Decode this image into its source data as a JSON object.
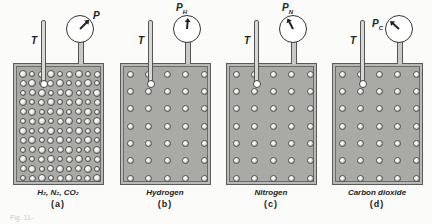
{
  "figure": {
    "caption_fragment": "Fig. 11-",
    "panels": [
      {
        "id": "a",
        "letter": "(a)",
        "gas_label": "H₂, N₂, CO₂",
        "thermometer_label": "T",
        "gauge_label": "P",
        "gauge_subscript": "",
        "needle_angle_deg": 45,
        "needle_length": 10,
        "grid_cols": 9,
        "grid_rows": 12,
        "mixed_sizes": true
      },
      {
        "id": "b",
        "letter": "(b)",
        "gas_label": "Hydrogen",
        "thermometer_label": "T",
        "gauge_label": "P",
        "gauge_subscript": "H",
        "needle_angle_deg": 5,
        "needle_length": 8,
        "grid_cols": 5,
        "grid_rows": 7,
        "mixed_sizes": false
      },
      {
        "id": "c",
        "letter": "(c)",
        "gas_label": "Nitrogen",
        "thermometer_label": "T",
        "gauge_label": "P",
        "gauge_subscript": "N",
        "needle_angle_deg": -28,
        "needle_length": 9,
        "grid_cols": 5,
        "grid_rows": 7,
        "mixed_sizes": false
      },
      {
        "id": "d",
        "letter": "(d)",
        "gas_label": "Carbon dioxide",
        "thermometer_label": "T",
        "gauge_label": "P",
        "gauge_subscript": "C",
        "needle_angle_deg": -48,
        "needle_length": 9,
        "grid_cols": 5,
        "grid_rows": 7,
        "mixed_sizes": false
      }
    ]
  },
  "colors": {
    "vessel_fill": "#a9a9a5",
    "outline": "#555555",
    "molecule": "#ffffff",
    "background": "#fbfbfa"
  }
}
